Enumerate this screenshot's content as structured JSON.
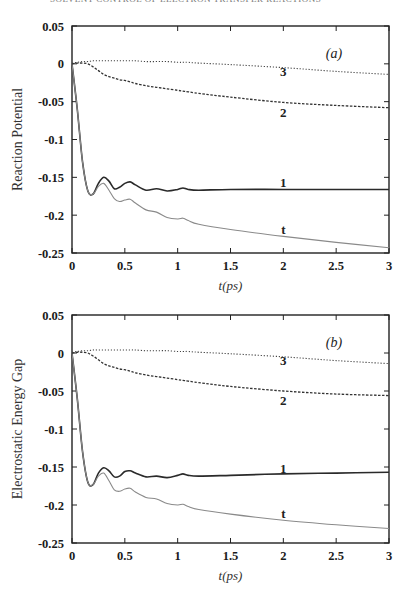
{
  "page": {
    "header_fragment": "SOLVENT CONTROL OF ELECTRON TRANSFER REACTIONS"
  },
  "chart_data": [
    {
      "type": "line",
      "panel_label": "(a)",
      "title": "",
      "xlabel": "t(ps)",
      "ylabel": "Reaction Potential",
      "xlim": [
        0,
        3
      ],
      "ylim": [
        -0.25,
        0.05
      ],
      "xticks": [
        "0",
        "0.5",
        "1",
        "1.5",
        "2",
        "2.5",
        "3"
      ],
      "yticks": [
        "0.05",
        "0",
        "-0.05",
        "-0.1",
        "-0.15",
        "-0.2",
        "-0.25"
      ],
      "grid": false,
      "legend": "inline curve labels",
      "x": [
        0,
        0.05,
        0.1,
        0.15,
        0.2,
        0.25,
        0.3,
        0.35,
        0.4,
        0.45,
        0.5,
        0.55,
        0.6,
        0.7,
        0.8,
        0.9,
        1.0,
        1.05,
        1.1,
        1.2,
        1.5,
        2.0,
        2.5,
        3.0
      ],
      "series": [
        {
          "name": "1",
          "style": "solid",
          "values": [
            0,
            -0.06,
            -0.13,
            -0.168,
            -0.172,
            -0.158,
            -0.15,
            -0.155,
            -0.165,
            -0.163,
            -0.158,
            -0.156,
            -0.16,
            -0.167,
            -0.165,
            -0.168,
            -0.166,
            -0.164,
            -0.166,
            -0.167,
            -0.166,
            -0.166,
            -0.166,
            -0.166
          ]
        },
        {
          "name": "t",
          "style": "dotted-gray",
          "values": [
            0,
            -0.06,
            -0.13,
            -0.168,
            -0.172,
            -0.162,
            -0.158,
            -0.167,
            -0.178,
            -0.182,
            -0.18,
            -0.179,
            -0.184,
            -0.193,
            -0.196,
            -0.203,
            -0.205,
            -0.204,
            -0.207,
            -0.212,
            -0.219,
            -0.228,
            -0.236,
            -0.243
          ]
        },
        {
          "name": "2",
          "style": "dashed",
          "values": [
            0,
            0.001,
            0.001,
            0.0,
            -0.004,
            -0.009,
            -0.014,
            -0.017,
            -0.019,
            -0.021,
            -0.022,
            -0.024,
            -0.026,
            -0.029,
            -0.031,
            -0.033,
            -0.035,
            -0.036,
            -0.037,
            -0.039,
            -0.044,
            -0.051,
            -0.055,
            -0.058
          ]
        },
        {
          "name": "3",
          "style": "dotted",
          "values": [
            0.001,
            0.002,
            0.003,
            0.003,
            0.004,
            0.004,
            0.004,
            0.004,
            0.004,
            0.004,
            0.004,
            0.004,
            0.004,
            0.003,
            0.003,
            0.003,
            0.002,
            0.002,
            0.002,
            0.001,
            -0.001,
            -0.005,
            -0.01,
            -0.014
          ]
        }
      ],
      "annotations": [
        {
          "text": "3",
          "x": 2.0,
          "y": -0.011
        },
        {
          "text": "2",
          "x": 2.0,
          "y": -0.065
        },
        {
          "text": "1",
          "x": 2.0,
          "y": -0.158
        },
        {
          "text": "t",
          "x": 2.0,
          "y": -0.219
        }
      ]
    },
    {
      "type": "line",
      "panel_label": "(b)",
      "title": "",
      "xlabel": "t(ps)",
      "ylabel": "Electrostatic Energy Gap",
      "xlim": [
        0,
        3
      ],
      "ylim": [
        -0.25,
        0.05
      ],
      "xticks": [
        "0",
        "0.5",
        "1",
        "1.5",
        "2",
        "2.5",
        "3"
      ],
      "yticks": [
        "0.05",
        "0",
        "-0.05",
        "-0.1",
        "-0.15",
        "-0.2",
        "-0.25"
      ],
      "grid": false,
      "legend": "inline curve labels",
      "x": [
        0,
        0.05,
        0.1,
        0.15,
        0.2,
        0.25,
        0.3,
        0.35,
        0.4,
        0.45,
        0.5,
        0.55,
        0.6,
        0.7,
        0.8,
        0.9,
        1.0,
        1.05,
        1.1,
        1.2,
        1.5,
        2.0,
        2.5,
        3.0
      ],
      "series": [
        {
          "name": "1",
          "style": "solid",
          "values": [
            0,
            -0.06,
            -0.13,
            -0.17,
            -0.173,
            -0.158,
            -0.151,
            -0.155,
            -0.163,
            -0.162,
            -0.156,
            -0.155,
            -0.158,
            -0.163,
            -0.162,
            -0.164,
            -0.161,
            -0.159,
            -0.161,
            -0.162,
            -0.161,
            -0.159,
            -0.158,
            -0.157
          ]
        },
        {
          "name": "t",
          "style": "dotted-gray",
          "values": [
            0,
            -0.06,
            -0.13,
            -0.17,
            -0.173,
            -0.162,
            -0.158,
            -0.168,
            -0.18,
            -0.182,
            -0.179,
            -0.178,
            -0.183,
            -0.19,
            -0.192,
            -0.198,
            -0.2,
            -0.199,
            -0.202,
            -0.206,
            -0.212,
            -0.22,
            -0.226,
            -0.231
          ]
        },
        {
          "name": "2",
          "style": "dashed",
          "values": [
            0,
            0.001,
            0.001,
            0.0,
            -0.004,
            -0.009,
            -0.014,
            -0.017,
            -0.019,
            -0.021,
            -0.022,
            -0.024,
            -0.026,
            -0.029,
            -0.031,
            -0.033,
            -0.035,
            -0.036,
            -0.037,
            -0.039,
            -0.044,
            -0.05,
            -0.054,
            -0.056
          ]
        },
        {
          "name": "3",
          "style": "dotted",
          "values": [
            0.001,
            0.002,
            0.003,
            0.003,
            0.004,
            0.004,
            0.004,
            0.004,
            0.004,
            0.004,
            0.004,
            0.004,
            0.004,
            0.003,
            0.003,
            0.003,
            0.002,
            0.002,
            0.002,
            0.001,
            -0.001,
            -0.005,
            -0.01,
            -0.014
          ]
        }
      ],
      "annotations": [
        {
          "text": "3",
          "x": 2.0,
          "y": -0.011
        },
        {
          "text": "2",
          "x": 2.0,
          "y": -0.063
        },
        {
          "text": "1",
          "x": 2.0,
          "y": -0.152
        },
        {
          "text": "t",
          "x": 2.0,
          "y": -0.212
        }
      ]
    }
  ]
}
